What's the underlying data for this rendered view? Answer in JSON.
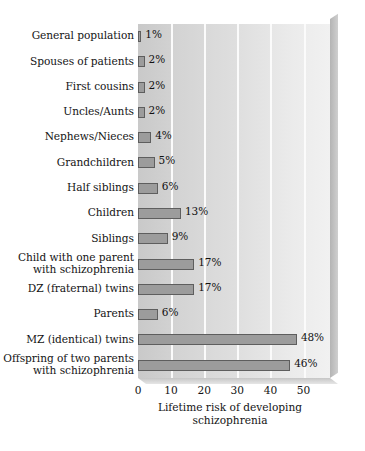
{
  "chart_data": {
    "type": "bar",
    "orientation": "horizontal",
    "title": "",
    "xlabel": "Lifetime risk of developing\nschizophrenia",
    "ylabel": "",
    "xlim": [
      0,
      58
    ],
    "xticks": [
      0,
      10,
      20,
      30,
      40,
      50
    ],
    "xtick_labels": [
      "0",
      "10",
      "20",
      "30",
      "40",
      "50"
    ],
    "grid": true,
    "grid_axis": "x",
    "legend": false,
    "value_suffix": "%",
    "categories": [
      "General population",
      "Spouses of patients",
      "First cousins",
      "Uncles/Aunts",
      "Nephews/Nieces",
      "Grandchildren",
      "Half siblings",
      "Children",
      "Siblings",
      "Child with one parent\nwith schizophrenia",
      "DZ (fraternal) twins",
      "Parents",
      "MZ (identical) twins",
      "Offspring of two parents\nwith schizophrenia"
    ],
    "values": [
      1,
      2,
      2,
      2,
      4,
      5,
      6,
      13,
      9,
      17,
      17,
      6,
      48,
      46
    ],
    "value_labels": [
      "1%",
      "2%",
      "2%",
      "2%",
      "4%",
      "5%",
      "6%",
      "13%",
      "9%",
      "17%",
      "17%",
      "6%",
      "48%",
      "46%"
    ],
    "colors": {
      "bar_fill": "#9c9c9c",
      "bar_border": "#5e5e5e",
      "plot_background_left": "#c9c9c9",
      "plot_background_right": "#f1f1f1",
      "gridline": "#fbfbfb",
      "text": "#141414",
      "figure_background": "#ffffff"
    }
  }
}
